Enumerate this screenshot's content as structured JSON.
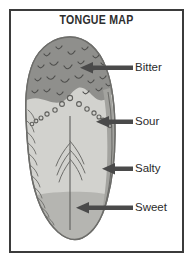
{
  "figure": {
    "title": "TONGUE MAP",
    "kind": "anatomical-diagram"
  },
  "colors": {
    "frame": "#3b3b3b",
    "background": "#ffffff",
    "title_text": "#2e2e2e",
    "label_text": "#2b2b2b",
    "bitter_zone": "#8f8f8c",
    "body_zone": "#d2d2ce",
    "lateral_band": "#a3a39f",
    "sweet_zone": "#b5b5b1",
    "outline": "#6d6d6a",
    "arrow": "#4a4a4a",
    "papilla_stroke": "#5f5f5c"
  },
  "zones": [
    {
      "id": "bitter",
      "label": "Bitter",
      "region": "posterior / back of tongue",
      "fill": "#8f8f8c"
    },
    {
      "id": "sour",
      "label": "Sour",
      "region": "posterior lateral edge",
      "fill": "#a3a39f"
    },
    {
      "id": "salty",
      "label": "Salty",
      "region": "anterior lateral edge",
      "fill": "#a3a39f"
    },
    {
      "id": "sweet",
      "label": "Sweet",
      "region": "tip of tongue",
      "fill": "#b5b5b1"
    }
  ],
  "callouts": [
    {
      "id": "bitter",
      "label": "Bitter",
      "arrow_from_x": 133,
      "arrow_to_x": 83,
      "arrow_y": 68
    },
    {
      "id": "sour",
      "label": "Sour",
      "arrow_from_x": 133,
      "arrow_to_x": 99,
      "arrow_y": 122
    },
    {
      "id": "salty",
      "label": "Salty",
      "arrow_from_x": 133,
      "arrow_to_x": 105,
      "arrow_y": 169
    },
    {
      "id": "sweet",
      "label": "Sweet",
      "arrow_from_x": 133,
      "arrow_to_x": 79,
      "arrow_y": 208
    }
  ]
}
